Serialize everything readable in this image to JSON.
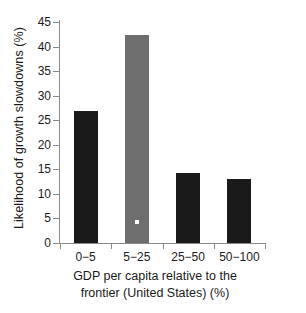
{
  "chart_data": {
    "type": "bar",
    "title": "",
    "subtitle": "",
    "xlabel": "GDP per capita relative to the frontier (United States) (%)",
    "xlabel_line1": "GDP per capita relative to the",
    "xlabel_line2": "frontier (United States) (%)",
    "ylabel": "Likelihood of growth slowdowns (%)",
    "categories": [
      "0−5",
      "5−25",
      "25−50",
      "50−100"
    ],
    "values": [
      26.8,
      42.3,
      14.3,
      13.0
    ],
    "bar_colors": [
      "#1a1a1a",
      "#6e6e6e",
      "#1a1a1a",
      "#1a1a1a"
    ],
    "highlighted_category": "5−25",
    "marker": {
      "category": "5−25",
      "value": 4.2,
      "color": "#ffffff",
      "shape": "square"
    },
    "ylim": [
      0,
      45
    ],
    "xlim": [
      0,
      4
    ],
    "yticks": [
      0,
      5,
      10,
      15,
      20,
      25,
      30,
      35,
      40,
      45
    ],
    "ytick_labels": [
      "0",
      "5",
      "10",
      "15",
      "20",
      "25",
      "30",
      "35",
      "40",
      "45"
    ],
    "grid": false,
    "legend": null,
    "legend_position": "none",
    "axis_color": "#8a8a8a",
    "text_color": "#1a1a1a",
    "background": "#ffffff"
  }
}
